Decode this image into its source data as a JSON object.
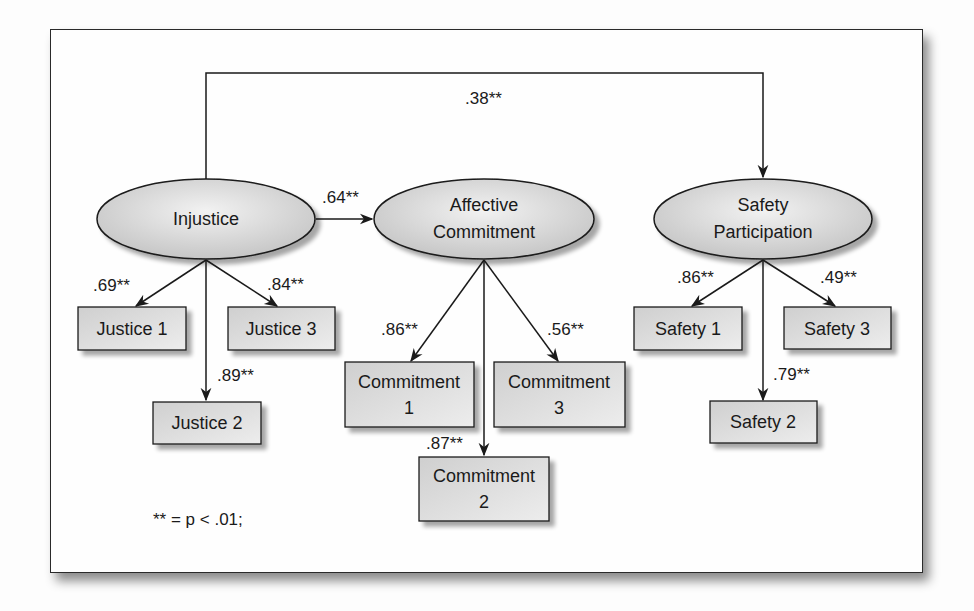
{
  "diagram": {
    "type": "structural-equation-model",
    "latent_variables": [
      {
        "id": "injustice",
        "label": "Injustice"
      },
      {
        "id": "affective_commitment",
        "label_line1": "Affective",
        "label_line2": "Commitment"
      },
      {
        "id": "safety_participation",
        "label_line1": "Safety",
        "label_line2": "Participation"
      }
    ],
    "indicators": {
      "justice_1": {
        "label": "Justice 1"
      },
      "justice_2": {
        "label": "Justice 2"
      },
      "justice_3": {
        "label": "Justice 3"
      },
      "commitment_1": {
        "line1": "Commitment",
        "line2": "1"
      },
      "commitment_2": {
        "line1": "Commitment",
        "line2": "2"
      },
      "commitment_3": {
        "line1": "Commitment",
        "line2": "3"
      },
      "safety_1": {
        "label": "Safety 1"
      },
      "safety_2": {
        "label": "Safety 2"
      },
      "safety_3": {
        "label": "Safety 3"
      }
    },
    "paths": {
      "injustice_to_safety": ".38**",
      "injustice_to_commitment": ".64**",
      "injustice_justice_1": ".69**",
      "injustice_justice_2": ".89**",
      "injustice_justice_3": ".84**",
      "commitment_commitment_1": ".86**",
      "commitment_commitment_2": ".87**",
      "commitment_commitment_3": ".56**",
      "safety_safety_1": ".86**",
      "safety_safety_2": ".79**",
      "safety_safety_3": ".49**"
    },
    "note": "** = p < .01;"
  },
  "colors": {
    "node_fill_light": "#f0f0f0",
    "node_fill_dark": "#c8c8c8",
    "stroke": "#1a1a1a"
  }
}
